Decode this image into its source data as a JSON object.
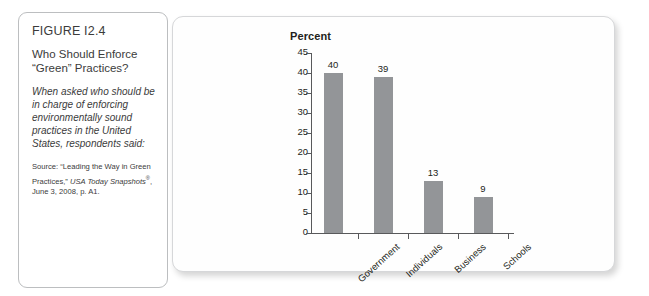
{
  "figure": {
    "number": "FIGURE I2.4",
    "title": "Who Should Enforce “Green” Practices?",
    "lede": "When asked who should be in charge of enforcing environmentally sound practices in the United States, respondents said:",
    "source_prefix": "Source: “Leading the Way in Green Practices,” ",
    "source_italic": "USA Today Snapshots",
    "source_mark": "®",
    "source_suffix": ", June 3, 2008, p. A1."
  },
  "chart_data": {
    "type": "bar",
    "title": "Percent",
    "categories": [
      "Government",
      "Individuals",
      "Business",
      "Schools"
    ],
    "values": [
      40,
      39,
      13,
      9
    ],
    "value_labels": [
      "40",
      "39",
      "13",
      "9"
    ],
    "xlabel": "",
    "ylabel": "Percent",
    "ylim": [
      0,
      45
    ],
    "yticks": [
      0,
      5,
      10,
      15,
      20,
      25,
      30,
      35,
      40,
      45
    ],
    "ytick_labels": [
      "0",
      "5",
      "10",
      "15",
      "20",
      "25",
      "30",
      "35",
      "40",
      "45"
    ],
    "grid": false,
    "legend": false,
    "bar_color": "#939598",
    "axis_color": "#58595b"
  },
  "colors": {
    "background": "#ffffff",
    "card_border": "#bcbec0",
    "panel_border": "#d6d7d9",
    "text": "#231f20",
    "bar": "#939598"
  }
}
